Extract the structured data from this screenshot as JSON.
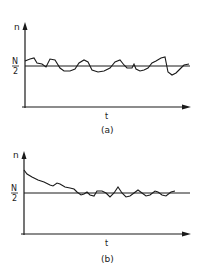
{
  "panels": [
    {
      "id": "a",
      "caption": "(a)",
      "y_label": "n",
      "x_label": "t",
      "level_label_num": "N",
      "level_label_den": "2",
      "description": "Fluctuation of n around N/2 starting near equilibrium"
    },
    {
      "id": "b",
      "caption": "(b)",
      "y_label": "n",
      "x_label": "t",
      "level_label_num": "N",
      "level_label_den": "2",
      "description": "n relaxing from a high initial value toward N/2, then fluctuating"
    }
  ],
  "colors": {
    "ink": "#1a1a1a",
    "background": "#ffffff"
  }
}
